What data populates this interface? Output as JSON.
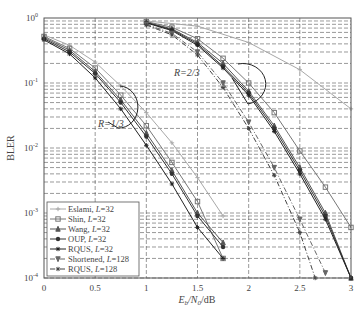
{
  "chart_data": {
    "type": "line",
    "title": "",
    "xlabel": "E_b/N_0/dB",
    "ylabel": "BLER",
    "yscale": "log",
    "xlim": [
      0,
      3
    ],
    "ylim": [
      0.0001,
      1
    ],
    "x_ticks": [
      "0",
      "0.5",
      "1",
      "1.5",
      "2",
      "2.5",
      "3"
    ],
    "y_ticks": [
      "10^0",
      "10^-1",
      "10^-2",
      "10^-3",
      "10^-4"
    ],
    "grid": true,
    "legend_position": "lower-left",
    "annotations": [
      {
        "text": "R=1/3",
        "x": 0.85,
        "y": 0.03
      },
      {
        "text": "R=2/3",
        "x": 1.75,
        "y": 0.2
      }
    ],
    "series": [
      {
        "name": "Eslami, L=32",
        "color": "#a8a8a8",
        "marker": "plus",
        "dash": "solid",
        "groups": [
          {
            "x": [
              0,
              0.25,
              0.5,
              0.75,
              1.0,
              1.25,
              1.5,
              1.75
            ],
            "y": [
              0.55,
              0.38,
              0.21,
              0.09,
              0.035,
              0.012,
              0.0035,
              0.0009
            ]
          },
          {
            "x": [
              1.0,
              1.5,
              2.0,
              2.5,
              3.0
            ],
            "y": [
              0.9,
              0.75,
              0.42,
              0.16,
              0.04
            ]
          }
        ]
      },
      {
        "name": "Shin, L=32",
        "color": "#777777",
        "marker": "square",
        "dash": "solid",
        "groups": [
          {
            "x": [
              0,
              0.25,
              0.5,
              0.75,
              1.0,
              1.25,
              1.5,
              1.75
            ],
            "y": [
              0.52,
              0.34,
              0.17,
              0.065,
              0.022,
              0.006,
              0.0015,
              0.0002
            ]
          },
          {
            "x": [
              1.0,
              1.25,
              1.5,
              1.75,
              2.0,
              2.25,
              2.5,
              2.75,
              3.0
            ],
            "y": [
              0.88,
              0.72,
              0.48,
              0.24,
              0.1,
              0.035,
              0.009,
              0.0025,
              0.0006
            ]
          }
        ]
      },
      {
        "name": "Wang, L=32",
        "color": "#555555",
        "marker": "triangle-up",
        "dash": "solid",
        "groups": [
          {
            "x": [
              0,
              0.25,
              0.5,
              0.75,
              1.0,
              1.25,
              1.5,
              1.75
            ],
            "y": [
              0.5,
              0.32,
              0.15,
              0.055,
              0.017,
              0.0045,
              0.001,
              0.00035
            ]
          },
          {
            "x": [
              1.0,
              1.25,
              1.5,
              1.75,
              2.0,
              2.25,
              2.5,
              2.75,
              3.0
            ],
            "y": [
              0.86,
              0.68,
              0.42,
              0.2,
              0.075,
              0.022,
              0.005,
              0.001,
              0.0001
            ]
          }
        ]
      },
      {
        "name": "OUP, L=32",
        "color": "#333333",
        "marker": "circle",
        "dash": "solid",
        "groups": [
          {
            "x": [
              0,
              0.25,
              0.5,
              0.75,
              1.0,
              1.25,
              1.5,
              1.75
            ],
            "y": [
              0.48,
              0.3,
              0.14,
              0.05,
              0.015,
              0.004,
              0.0009,
              0.0003
            ]
          },
          {
            "x": [
              1.0,
              1.25,
              1.5,
              1.75,
              2.0,
              2.25,
              2.5,
              2.75,
              3.0
            ],
            "y": [
              0.85,
              0.66,
              0.4,
              0.18,
              0.07,
              0.02,
              0.0045,
              0.0009,
              0.0001
            ]
          }
        ]
      },
      {
        "name": "RQUS, L=32",
        "color": "#222222",
        "marker": "star",
        "dash": "solid",
        "groups": [
          {
            "x": [
              0,
              0.25,
              0.5,
              0.75,
              1.0,
              1.25,
              1.5,
              1.75
            ],
            "y": [
              0.46,
              0.28,
              0.12,
              0.04,
              0.011,
              0.0028,
              0.0006,
              0.0002
            ]
          },
          {
            "x": [
              1.0,
              1.25,
              1.5,
              1.75,
              2.0,
              2.25,
              2.5,
              2.75,
              3.0
            ],
            "y": [
              0.84,
              0.64,
              0.38,
              0.17,
              0.065,
              0.018,
              0.004,
              0.0008,
              0.0001
            ]
          }
        ]
      },
      {
        "name": "Shortened, L=128",
        "color": "#666666",
        "marker": "triangle-down",
        "dash": "dashdot",
        "groups": [
          {
            "x": [
              1.0,
              1.25,
              1.5,
              1.75,
              2.0,
              2.25,
              2.5,
              2.75
            ],
            "y": [
              0.8,
              0.58,
              0.3,
              0.1,
              0.025,
              0.005,
              0.0008,
              0.00012
            ]
          }
        ]
      },
      {
        "name": "RQUS, L=128",
        "color": "#444444",
        "marker": "star",
        "dash": "dashdot",
        "groups": [
          {
            "x": [
              1.0,
              1.25,
              1.5,
              1.75,
              2.0,
              2.25,
              2.5,
              2.65
            ],
            "y": [
              0.78,
              0.55,
              0.27,
              0.085,
              0.02,
              0.0038,
              0.0005,
              0.0001
            ]
          }
        ]
      }
    ]
  }
}
